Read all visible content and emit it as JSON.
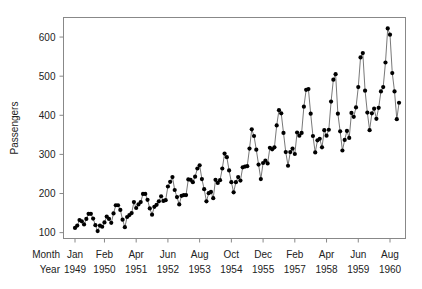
{
  "chart_data": {
    "type": "line",
    "title": "",
    "xlabel": "",
    "ylabel": "Passengers",
    "ylim": [
      85,
      650
    ],
    "yticks": [
      100,
      200,
      300,
      400,
      500,
      600
    ],
    "ytick_labels": [
      "100",
      "200",
      "300",
      "400",
      "500",
      "600"
    ],
    "grid": false,
    "legend": "none",
    "marker": "filled-circle",
    "line_style": "solid",
    "series": [
      {
        "name": "Passengers",
        "values": [
          112,
          118,
          132,
          129,
          121,
          135,
          148,
          148,
          136,
          119,
          104,
          118,
          115,
          126,
          141,
          135,
          125,
          149,
          170,
          170,
          158,
          133,
          114,
          140,
          145,
          150,
          178,
          163,
          172,
          178,
          199,
          199,
          184,
          162,
          146,
          166,
          171,
          180,
          193,
          181,
          183,
          218,
          230,
          242,
          209,
          191,
          172,
          194,
          196,
          196,
          236,
          235,
          229,
          243,
          264,
          272,
          237,
          211,
          180,
          201,
          204,
          188,
          235,
          227,
          234,
          264,
          302,
          293,
          259,
          229,
          203,
          229,
          242,
          233,
          267,
          269,
          270,
          315,
          364,
          347,
          312,
          274,
          237,
          278,
          284,
          277,
          317,
          313,
          318,
          374,
          413,
          405,
          355,
          306,
          271,
          306,
          315,
          301,
          356,
          348,
          355,
          422,
          465,
          467,
          404,
          347,
          305,
          336,
          340,
          318,
          362,
          348,
          363,
          435,
          491,
          505,
          404,
          359,
          310,
          337,
          360,
          342,
          406,
          396,
          420,
          472,
          548,
          559,
          463,
          407,
          362,
          405,
          417,
          391,
          419,
          461,
          472,
          535,
          622,
          606,
          508,
          461,
          390,
          432
        ]
      }
    ],
    "x_axis": {
      "row_labels": [
        "Month",
        "Year"
      ],
      "tick_months": [
        "Jan",
        "Feb",
        "Apr",
        "Jun",
        "Aug",
        "Oct",
        "Dec",
        "Feb",
        "Apr",
        "Jun",
        "Aug"
      ],
      "tick_years": [
        "1949",
        "1950",
        "1951",
        "1952",
        "1953",
        "1954",
        "1955",
        "1957",
        "1958",
        "1959",
        "1960"
      ],
      "tick_indices": [
        0,
        13,
        27,
        41,
        55,
        69,
        83,
        97,
        111,
        125,
        139
      ]
    },
    "colors": {
      "marker": "#000000",
      "line": "#555555",
      "frame": "#888888",
      "text": "#222222",
      "background": "#ffffff"
    }
  }
}
